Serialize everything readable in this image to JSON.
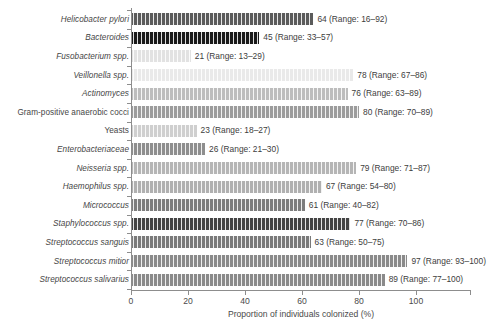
{
  "chart_data": {
    "type": "bar",
    "orientation": "horizontal",
    "title": "",
    "xlabel": "Proportion of individuals colonized (%)",
    "ylabel": "",
    "xlim": [
      0,
      118
    ],
    "xticks": [
      0,
      20,
      40,
      60,
      80,
      100
    ],
    "xtick_labels": [
      "0",
      "20",
      "40",
      "60",
      "80",
      "100"
    ],
    "grid": false,
    "legend": false,
    "categories": [
      "Helicobacter pylori",
      "Bacteroides",
      "Fusobacterium spp.",
      "Veillonella spp.",
      "Actinomyces",
      "Gram-positive anaerobic cocci",
      "Yeasts",
      "Enterobacteriaceae",
      "Neisseria spp.",
      "Haemophilus spp.",
      "Micrococcus",
      "Staphylococcus spp.",
      "Streptococcus sanguis",
      "Streptococcus mitior",
      "Streptococcus salivarius"
    ],
    "values": [
      64,
      45,
      21,
      78,
      76,
      80,
      23,
      26,
      79,
      67,
      61,
      77,
      63,
      97,
      89
    ],
    "ranges": [
      [
        16,
        92
      ],
      [
        33,
        57
      ],
      [
        13,
        29
      ],
      [
        67,
        86
      ],
      [
        63,
        89
      ],
      [
        70,
        89
      ],
      [
        18,
        27
      ],
      [
        21,
        30
      ],
      [
        71,
        87
      ],
      [
        54,
        80
      ],
      [
        40,
        82
      ],
      [
        70,
        86
      ],
      [
        50,
        75
      ],
      [
        93,
        100
      ],
      [
        77,
        100
      ]
    ],
    "value_labels": [
      "64 (Range: 16–92)",
      "45 (Range: 33–57)",
      "21 (Range: 13–29)",
      "78 (Range: 67–86)",
      "76 (Range: 63–89)",
      "80 (Range: 70–89)",
      "23 (Range: 18–27)",
      "26 (Range: 21–30)",
      "79 (Range: 71–87)",
      "67 (Range: 54–80)",
      "61 (Range: 40–82)",
      "77 (Range: 70–86)",
      "63 (Range: 50–75)",
      "97 (Range: 93–100)",
      "89 (Range: 77–100)"
    ],
    "bar_colors": [
      "#5b5b5b",
      "#1a1a1a",
      "#e2e2e2",
      "#e9e9e9",
      "#bdbdbd",
      "#9c9c9c",
      "#cfcfcf",
      "#8e8e8e",
      "#b5b5b5",
      "#b0b0b0",
      "#7d7d7d",
      "#444444",
      "#7a7a7a",
      "#8a8a8a",
      "#8a8a8a"
    ],
    "label_styles": [
      "italic",
      "italic",
      "mixed",
      "mixed",
      "italic",
      "upright",
      "upright",
      "italic",
      "mixed",
      "mixed",
      "italic",
      "mixed",
      "italic",
      "italic",
      "italic"
    ]
  }
}
